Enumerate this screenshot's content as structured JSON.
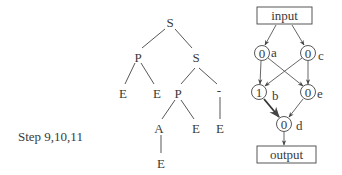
{
  "step_label": "Step 9,10,11",
  "tree": {
    "nodes": [
      {
        "id": "root",
        "label": "S"
      },
      {
        "id": "p1",
        "label": "P"
      },
      {
        "id": "s2",
        "label": "S"
      },
      {
        "id": "e1",
        "label": "E"
      },
      {
        "id": "e2",
        "label": "E"
      },
      {
        "id": "p2",
        "label": "P"
      },
      {
        "id": "dash",
        "label": "-"
      },
      {
        "id": "a",
        "label": "A"
      },
      {
        "id": "e3",
        "label": "E"
      },
      {
        "id": "e4",
        "label": "E"
      },
      {
        "id": "e5",
        "label": "E"
      }
    ],
    "edges": [
      [
        "root",
        "p1"
      ],
      [
        "root",
        "s2"
      ],
      [
        "p1",
        "e1"
      ],
      [
        "p1",
        "e2"
      ],
      [
        "s2",
        "p2"
      ],
      [
        "s2",
        "dash"
      ],
      [
        "p2",
        "a"
      ],
      [
        "p2",
        "e3"
      ],
      [
        "dash",
        "e4"
      ],
      [
        "a",
        "e5"
      ]
    ]
  },
  "graph": {
    "input_label": "input",
    "output_label": "output",
    "nodes": [
      {
        "id": "a",
        "value": "0",
        "name": "a"
      },
      {
        "id": "c",
        "value": "0",
        "name": "c"
      },
      {
        "id": "b",
        "value": "1",
        "name": "b"
      },
      {
        "id": "e",
        "value": "0",
        "name": "e"
      },
      {
        "id": "d",
        "value": "0",
        "name": "d"
      }
    ],
    "edges": [
      [
        "input",
        "a"
      ],
      [
        "input",
        "c"
      ],
      [
        "a",
        "b"
      ],
      [
        "a",
        "e"
      ],
      [
        "c",
        "b"
      ],
      [
        "c",
        "e"
      ],
      [
        "b",
        "d"
      ],
      [
        "e",
        "d"
      ],
      [
        "d",
        "output"
      ]
    ]
  }
}
